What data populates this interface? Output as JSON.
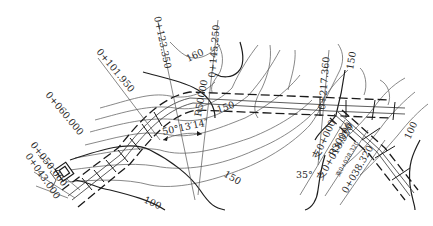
{
  "drawing": {
    "type": "road alignment plan on topographic contour map",
    "stations": {
      "s0": "0+043.000",
      "s1": "0+050.000",
      "s2": "0+060.000",
      "s3": "0+101.950",
      "s4": "0+123.350",
      "s5": "0+145.250",
      "s6": "0+217.360"
    },
    "branch_stations": {
      "b0": "支0+000",
      "b1": "支0+018.320",
      "b2": "支0+028.320",
      "b3": "0+038.320"
    },
    "curves": {
      "main_radius": "R50000",
      "branch_radius": "R30000",
      "deflection_angle": "50°13′14″",
      "branch_angle": "35°"
    },
    "contours": {
      "c160": "160",
      "c150a": "150",
      "c150b": "150",
      "c150c": "150",
      "c100a": "100",
      "c100b": "100"
    },
    "colors": {
      "background": "#ffffff",
      "line": "#1a1a1a",
      "contour": "#6a6a6a"
    }
  }
}
